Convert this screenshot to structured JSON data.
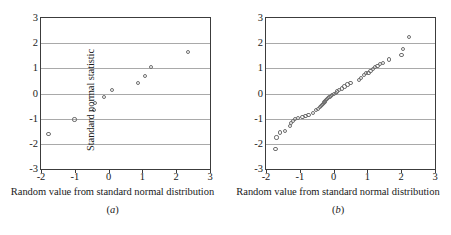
{
  "figure": {
    "panels": [
      {
        "id": "panel-a",
        "caption": "(a)",
        "caption_open": "(",
        "caption_letter": "a",
        "caption_close": ")",
        "xlabel": "Random value from standard normal distribution",
        "ylabel": "Standard normal statistic"
      },
      {
        "id": "panel-b",
        "caption": "(b)",
        "caption_open": "(",
        "caption_letter": "b",
        "caption_close": ")",
        "xlabel": "Random value from standard normal distribution",
        "ylabel": "Standard normal statistic"
      }
    ]
  },
  "chart_data": [
    {
      "type": "scatter",
      "title": "",
      "subtitle": "(a)",
      "xlabel": "Random value from standard normal distribution",
      "ylabel": "Standard normal statistic",
      "xlim": [
        -2,
        3
      ],
      "ylim": [
        -3,
        3
      ],
      "xticks": [
        -2,
        -1,
        0,
        1,
        2,
        3
      ],
      "yticks": [
        -3,
        -2,
        -1,
        0,
        1,
        2,
        3
      ],
      "xtick_labels": [
        "-2",
        "-1",
        "0",
        "1",
        "2",
        "3"
      ],
      "ytick_labels": [
        "-3",
        "-2",
        "-1",
        "0",
        "1",
        "2",
        "3"
      ],
      "grid": "horizontal",
      "legend": "none",
      "marker": "open-circle",
      "n_points": 10,
      "points": [
        {
          "x": -1.78,
          "y": -1.62
        },
        {
          "x": -1.01,
          "y": -1.03
        },
        {
          "x": -0.42,
          "y": -0.66
        },
        {
          "x": -0.4,
          "y": -0.37
        },
        {
          "x": -0.14,
          "y": -0.13
        },
        {
          "x": 0.1,
          "y": 0.13
        },
        {
          "x": 0.88,
          "y": 0.41
        },
        {
          "x": 1.07,
          "y": 0.68
        },
        {
          "x": 1.26,
          "y": 1.04
        },
        {
          "x": 2.35,
          "y": 1.65
        }
      ]
    },
    {
      "type": "scatter",
      "title": "",
      "subtitle": "(b)",
      "xlabel": "Random value from standard normal distribution",
      "ylabel": "Standard normal statistic",
      "xlim": [
        -2,
        3
      ],
      "ylim": [
        -3,
        3
      ],
      "xticks": [
        -2,
        -1,
        0,
        1,
        2,
        3
      ],
      "yticks": [
        -3,
        -2,
        -1,
        0,
        1,
        2,
        3
      ],
      "xtick_labels": [
        "-2",
        "-1",
        "0",
        "1",
        "2",
        "3"
      ],
      "ytick_labels": [
        "-3",
        "-2",
        "-1",
        "0",
        "1",
        "2",
        "3"
      ],
      "grid": "horizontal",
      "legend": "none",
      "marker": "open-circle",
      "n_points": 50,
      "points": [
        {
          "x": -1.72,
          "y": -2.21
        },
        {
          "x": -1.69,
          "y": -1.75
        },
        {
          "x": -1.58,
          "y": -1.55
        },
        {
          "x": -1.44,
          "y": -1.49
        },
        {
          "x": -1.3,
          "y": -1.28
        },
        {
          "x": -1.26,
          "y": -1.17
        },
        {
          "x": -1.21,
          "y": -1.1
        },
        {
          "x": -1.13,
          "y": -1.02
        },
        {
          "x": -1.06,
          "y": -0.98
        },
        {
          "x": -0.92,
          "y": -0.93
        },
        {
          "x": -0.83,
          "y": -0.88
        },
        {
          "x": -0.74,
          "y": -0.84
        },
        {
          "x": -0.62,
          "y": -0.79
        },
        {
          "x": -0.52,
          "y": -0.66
        },
        {
          "x": -0.46,
          "y": -0.6
        },
        {
          "x": -0.41,
          "y": -0.55
        },
        {
          "x": -0.37,
          "y": -0.5
        },
        {
          "x": -0.34,
          "y": -0.45
        },
        {
          "x": -0.31,
          "y": -0.41
        },
        {
          "x": -0.29,
          "y": -0.37
        },
        {
          "x": -0.27,
          "y": -0.33
        },
        {
          "x": -0.25,
          "y": -0.29
        },
        {
          "x": -0.22,
          "y": -0.26
        },
        {
          "x": -0.19,
          "y": -0.22
        },
        {
          "x": -0.16,
          "y": -0.18
        },
        {
          "x": -0.12,
          "y": -0.14
        },
        {
          "x": -0.08,
          "y": -0.1
        },
        {
          "x": -0.04,
          "y": -0.06
        },
        {
          "x": 0.01,
          "y": -0.02
        },
        {
          "x": 0.06,
          "y": 0.03
        },
        {
          "x": 0.11,
          "y": 0.08
        },
        {
          "x": 0.17,
          "y": 0.13
        },
        {
          "x": 0.24,
          "y": 0.2
        },
        {
          "x": 0.32,
          "y": 0.28
        },
        {
          "x": 0.41,
          "y": 0.36
        },
        {
          "x": 0.5,
          "y": 0.43
        },
        {
          "x": 0.74,
          "y": 0.55
        },
        {
          "x": 0.82,
          "y": 0.63
        },
        {
          "x": 0.9,
          "y": 0.72
        },
        {
          "x": 0.97,
          "y": 0.8
        },
        {
          "x": 1.03,
          "y": 0.82
        },
        {
          "x": 1.09,
          "y": 0.9
        },
        {
          "x": 1.16,
          "y": 0.98
        },
        {
          "x": 1.22,
          "y": 1.05
        },
        {
          "x": 1.3,
          "y": 1.1
        },
        {
          "x": 1.37,
          "y": 1.18
        },
        {
          "x": 1.45,
          "y": 1.22
        },
        {
          "x": 1.63,
          "y": 1.35
        },
        {
          "x": 2.01,
          "y": 1.53
        },
        {
          "x": 2.06,
          "y": 1.78
        },
        {
          "x": 2.24,
          "y": 2.24
        }
      ]
    }
  ]
}
